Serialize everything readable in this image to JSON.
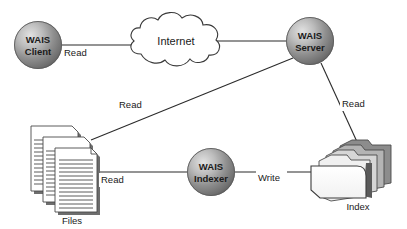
{
  "diagram": {
    "background_color": "#ffffff",
    "line_color": "#2b2b2b",
    "text_color": "#1a1a1a",
    "nodes": [
      {
        "id": "wais-client",
        "shape": "sphere",
        "line1": "WAIS",
        "line2": "Client",
        "cx": 38,
        "cy": 45,
        "r": 24
      },
      {
        "id": "internet-cloud",
        "shape": "cloud",
        "label": "Internet",
        "cx": 176,
        "cy": 41
      },
      {
        "id": "wais-server",
        "shape": "sphere",
        "line1": "WAIS",
        "line2": "Server",
        "cx": 310,
        "cy": 41,
        "r": 24
      },
      {
        "id": "wais-indexer",
        "shape": "sphere",
        "line1": "WAIS",
        "line2": "Indexer",
        "cx": 211,
        "cy": 172,
        "r": 24
      },
      {
        "id": "files-stack",
        "shape": "document-stack",
        "caption": "Files",
        "caption_x": 72,
        "caption_y": 221
      },
      {
        "id": "index-folder",
        "shape": "folder-stack",
        "caption": "Index",
        "caption_x": 358,
        "caption_y": 207
      }
    ],
    "edges": [
      {
        "id": "client-to-internet",
        "from": "wais-client",
        "to": "internet-cloud",
        "label": "Read",
        "label_x": 65,
        "label_y": 53
      },
      {
        "id": "internet-to-server",
        "from": "internet-cloud",
        "to": "wais-server",
        "label": "",
        "label_x": 0,
        "label_y": 0
      },
      {
        "id": "server-to-files",
        "from": "wais-server",
        "to": "files-stack",
        "label": "Read",
        "label_x": 120,
        "label_y": 105
      },
      {
        "id": "server-to-index",
        "from": "wais-server",
        "to": "index-folder",
        "label": "Read",
        "label_x": 343,
        "label_y": 104
      },
      {
        "id": "files-to-indexer",
        "from": "files-stack",
        "to": "wais-indexer",
        "label": "Read",
        "label_x": 102,
        "label_y": 180
      },
      {
        "id": "indexer-to-index",
        "from": "wais-indexer",
        "to": "index-folder",
        "label": "Write",
        "label_x": 259,
        "label_y": 178
      }
    ]
  }
}
